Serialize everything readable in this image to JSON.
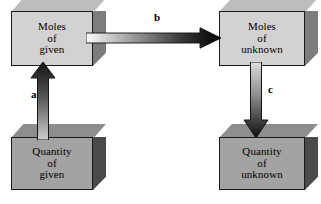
{
  "diagram": {
    "background_color": "#ffffff",
    "boxes": [
      {
        "id": "moles-given",
        "lines": [
          "Moles",
          "of",
          "given"
        ],
        "shade": "light",
        "face_color": "#d2d2d2",
        "side_color": "#7d7d7d",
        "top_color": "#bdbdbd"
      },
      {
        "id": "moles-unknown",
        "lines": [
          "Moles",
          "of",
          "unknown"
        ],
        "shade": "light",
        "face_color": "#d2d2d2",
        "side_color": "#7d7d7d",
        "top_color": "#bdbdbd"
      },
      {
        "id": "quantity-given",
        "lines": [
          "Quantity",
          "of",
          "given"
        ],
        "shade": "dark",
        "face_color": "#a3a3a3",
        "side_color": "#4a4a4a",
        "top_color": "#8e8e8e"
      },
      {
        "id": "quantity-unknown",
        "lines": [
          "Quantity",
          "of",
          "unknown"
        ],
        "shade": "dark",
        "face_color": "#a3a3a3",
        "side_color": "#4a4a4a",
        "top_color": "#8e8e8e"
      }
    ],
    "arrows": [
      {
        "id": "a",
        "label": "a",
        "direction": "up",
        "from": "quantity-given",
        "to": "moles-given",
        "gradient_from": "#1a1a1a",
        "gradient_to": "#c9c9c9"
      },
      {
        "id": "b",
        "label": "b",
        "direction": "right",
        "from": "moles-given",
        "to": "moles-unknown",
        "gradient_from": "#f2f2f2",
        "gradient_to": "#000000"
      },
      {
        "id": "c",
        "label": "c",
        "direction": "down",
        "from": "moles-unknown",
        "to": "quantity-unknown",
        "gradient_from": "#d8d8d8",
        "gradient_to": "#111111"
      }
    ]
  }
}
